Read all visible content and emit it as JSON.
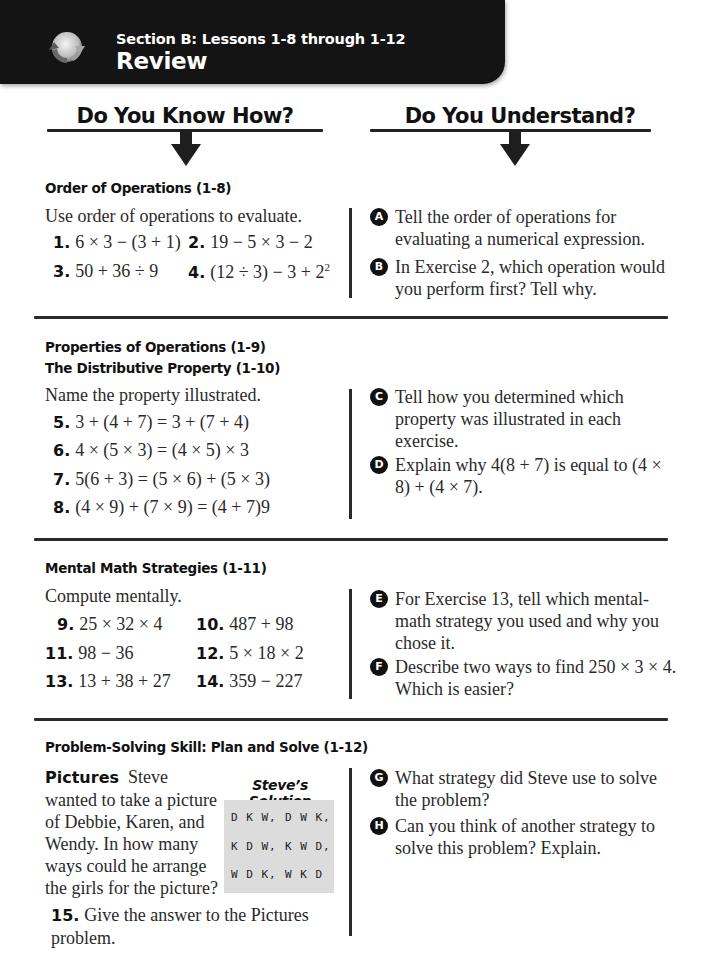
{
  "header": {
    "icon": "review-cycle-icon",
    "subtitle": "Section B: Lessons 1-8 through 1-12",
    "title": "Review",
    "banner_color": "#141414"
  },
  "columns": {
    "left_heading": "Do You Know How?",
    "right_heading": "Do You Understand?"
  },
  "sections": [
    {
      "titles": [
        "Order of Operations (1-8)"
      ],
      "instruction": "Use order of operations to evaluate.",
      "exercises": [
        {
          "num": "1.",
          "expr": "6 × 3 − (3 + 1)"
        },
        {
          "num": "2.",
          "expr": "19 − 5 × 3 − 2"
        },
        {
          "num": "3.",
          "expr": "50 + 36 ÷ 9"
        },
        {
          "num": "4.",
          "expr": "(12 ÷ 3) − 3 + 2",
          "sup": "2"
        }
      ],
      "questions": [
        {
          "letter": "A",
          "text": "Tell the order of operations for evaluating a numerical expression."
        },
        {
          "letter": "B",
          "text": "In Exercise 2, which operation would you perform first? Tell why."
        }
      ]
    },
    {
      "titles": [
        "Properties of Operations (1-9)",
        "The Distributive Property (1-10)"
      ],
      "instruction": "Name the property illustrated.",
      "exercises": [
        {
          "num": "5.",
          "expr": "3 + (4 + 7) = 3 + (7 + 4)"
        },
        {
          "num": "6.",
          "expr": "4 × (5 × 3) = (4 × 5) × 3"
        },
        {
          "num": "7.",
          "expr": "5(6 + 3) = (5 × 6) + (5 × 3)"
        },
        {
          "num": "8.",
          "expr": "(4 × 9) + (7 × 9) = (4 + 7)9"
        }
      ],
      "questions": [
        {
          "letter": "C",
          "text": "Tell how you determined which property was illustrated in each exercise."
        },
        {
          "letter": "D",
          "text": "Explain why 4(8 + 7) is equal to (4 × 8) + (4 × 7)."
        }
      ]
    },
    {
      "titles": [
        "Mental Math Strategies (1-11)"
      ],
      "instruction": "Compute mentally.",
      "exercises": [
        {
          "num": "9.",
          "expr": "25 × 32 × 4"
        },
        {
          "num": "10.",
          "expr": "487 + 98"
        },
        {
          "num": "11.",
          "expr": "98 − 36"
        },
        {
          "num": "12.",
          "expr": "5 × 18 × 2"
        },
        {
          "num": "13.",
          "expr": "13 + 38 + 27"
        },
        {
          "num": "14.",
          "expr": "359 − 227"
        }
      ],
      "questions": [
        {
          "letter": "E",
          "text": "For Exercise 13, tell which mental-math strategy you used and why you chose it."
        },
        {
          "letter": "F",
          "text": "Describe two ways to find 250 × 3 × 4. Which is easier?"
        }
      ]
    },
    {
      "titles": [
        "Problem-Solving Skill: Plan and Solve (1-12)"
      ],
      "problem": {
        "label": "Pictures",
        "text": "Steve wanted to take a picture of Debbie, Karen, and Wendy. In how many ways could he arrange the girls for the picture?"
      },
      "solution": {
        "title": "Steve’s Solution",
        "items": [
          "D K W,",
          "D W K,",
          "K D W,",
          "K W D,",
          "W D K,",
          "W K D"
        ]
      },
      "exercises": [
        {
          "num": "15.",
          "expr": "Give the answer to the Pictures problem."
        }
      ],
      "questions": [
        {
          "letter": "G",
          "text": "What strategy did Steve use to solve the problem?"
        },
        {
          "letter": "H",
          "text": "Can you think of another strategy to solve this problem? Explain."
        }
      ]
    }
  ]
}
